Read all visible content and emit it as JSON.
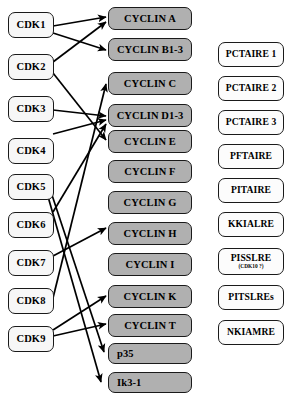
{
  "diagram": {
    "colors": {
      "background": "#ffffff",
      "cyclin_fill": "#b0b0b0",
      "cdk_fill": "#f7f7f7",
      "kinase_fill": "#fcfcfc",
      "border": "#1a1a1a",
      "edge": "#000000"
    }
  },
  "columns": {
    "cdks": {
      "name": "cyclin-dependent-kinases",
      "items": [
        {
          "id": "cdk1",
          "label": "CDK1"
        },
        {
          "id": "cdk2",
          "label": "CDK2"
        },
        {
          "id": "cdk3",
          "label": "CDK3"
        },
        {
          "id": "cdk4",
          "label": "CDK4"
        },
        {
          "id": "cdk5",
          "label": "CDK5"
        },
        {
          "id": "cdk6",
          "label": "CDK6"
        },
        {
          "id": "cdk7",
          "label": "CDK7"
        },
        {
          "id": "cdk8",
          "label": "CDK8"
        },
        {
          "id": "cdk9",
          "label": "CDK9"
        }
      ]
    },
    "cyclins": {
      "name": "cyclins-and-activators",
      "items": [
        {
          "id": "cycA",
          "label": "CYCLIN A"
        },
        {
          "id": "cycB",
          "label": "CYCLIN B1-3"
        },
        {
          "id": "cycC",
          "label": "CYCLIN C"
        },
        {
          "id": "cycD",
          "label": "CYCLIN D1-3"
        },
        {
          "id": "cycE",
          "label": "CYCLIN E"
        },
        {
          "id": "cycF",
          "label": "CYCLIN F"
        },
        {
          "id": "cycG",
          "label": "CYCLIN G"
        },
        {
          "id": "cycH",
          "label": "CYCLIN H"
        },
        {
          "id": "cycI",
          "label": "CYCLIN I"
        },
        {
          "id": "cycK",
          "label": "CYCLIN K"
        },
        {
          "id": "cycT",
          "label": "CYCLIN T"
        },
        {
          "id": "p35",
          "label": "p35"
        },
        {
          "id": "ik3",
          "label": "Ik3-1"
        }
      ]
    },
    "kinases": {
      "name": "cdk-related-kinases",
      "items": [
        {
          "id": "pctaire1",
          "label": "PCTAIRE 1",
          "sub": ""
        },
        {
          "id": "pctaire2",
          "label": "PCTAIRE 2",
          "sub": ""
        },
        {
          "id": "pctaire3",
          "label": "PCTAIRE 3",
          "sub": ""
        },
        {
          "id": "pftaire",
          "label": "PFTAIRE",
          "sub": ""
        },
        {
          "id": "pitaire",
          "label": "PITAIRE",
          "sub": ""
        },
        {
          "id": "kkialre",
          "label": "KKIALRE",
          "sub": ""
        },
        {
          "id": "pisslre",
          "label": "PISSLRE",
          "sub": "(CDK10 ?)"
        },
        {
          "id": "pitslres",
          "label": "PITSLREs",
          "sub": ""
        },
        {
          "id": "nkiamre",
          "label": "NKIAMRE",
          "sub": ""
        }
      ]
    }
  },
  "edges": [
    {
      "from": "CDK1",
      "to": "CYCLIN A"
    },
    {
      "from": "CDK1",
      "to": "CYCLIN B1-3"
    },
    {
      "from": "CDK2",
      "to": "CYCLIN A"
    },
    {
      "from": "CDK2",
      "to": "CYCLIN E"
    },
    {
      "from": "CDK3",
      "to": "CYCLIN D1-3"
    },
    {
      "from": "CDK4",
      "to": "CYCLIN D1-3"
    },
    {
      "from": "CDK5",
      "to": "p35"
    },
    {
      "from": "CDK5",
      "to": "Ik3-1"
    },
    {
      "from": "CDK6",
      "to": "CYCLIN D1-3"
    },
    {
      "from": "CDK7",
      "to": "CYCLIN H"
    },
    {
      "from": "CDK8",
      "to": "CYCLIN C"
    },
    {
      "from": "CDK9",
      "to": "CYCLIN K"
    },
    {
      "from": "CDK9",
      "to": "CYCLIN T"
    }
  ]
}
